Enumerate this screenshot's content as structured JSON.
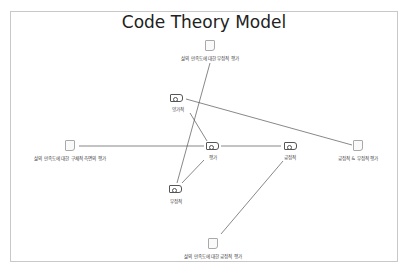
{
  "diagram": {
    "title": "Code Theory Model",
    "colors": {
      "border": "#c8c8c8",
      "edge": "#555555",
      "doc_icon": "#a9a9a9",
      "code_icon": "#555555",
      "label": "#444444"
    },
    "nodes": [
      {
        "id": "doc_negative_eval",
        "type": "document",
        "label": "삶의 만족도에 대한 부정적 평가",
        "x": 210,
        "y": 45
      },
      {
        "id": "code_ambivalent",
        "type": "code",
        "label": "양가적",
        "x": 180,
        "y": 97
      },
      {
        "id": "doc_specific_aspect",
        "type": "document",
        "label": "삶의 만족도에 대한 구체적 측면의 평가",
        "x": 70,
        "y": 146
      },
      {
        "id": "code_evaluation",
        "type": "code",
        "label": "평가",
        "x": 213,
        "y": 146
      },
      {
        "id": "code_positive",
        "type": "code",
        "label": "긍정적",
        "x": 290,
        "y": 146
      },
      {
        "id": "doc_pos_neg_eval",
        "type": "document",
        "label": "긍정적 & 부정적 평가",
        "x": 360,
        "y": 148
      },
      {
        "id": "code_negative",
        "type": "code",
        "label": "부정적",
        "x": 176,
        "y": 190
      },
      {
        "id": "doc_positive_eval",
        "type": "document",
        "label": "삶의 만족도에 대한 긍정적 평가",
        "x": 213,
        "y": 245
      }
    ],
    "edges": [
      {
        "from": "doc_negative_eval",
        "to": "code_negative",
        "x1": 210,
        "y1": 63,
        "x2": 177,
        "y2": 183
      },
      {
        "from": "code_ambivalent",
        "to": "doc_pos_neg_eval",
        "x1": 186,
        "y1": 99,
        "x2": 352,
        "y2": 145
      },
      {
        "from": "code_ambivalent",
        "to": "code_evaluation",
        "x1": 190,
        "y1": 113,
        "x2": 207,
        "y2": 141
      },
      {
        "from": "doc_specific_aspect",
        "to": "code_evaluation",
        "x1": 79,
        "y1": 146,
        "x2": 204,
        "y2": 146
      },
      {
        "from": "code_evaluation",
        "to": "code_positive",
        "x1": 221,
        "y1": 146,
        "x2": 281,
        "y2": 146
      },
      {
        "from": "code_evaluation",
        "to": "code_negative",
        "x1": 204,
        "y1": 160,
        "x2": 182,
        "y2": 183
      },
      {
        "from": "code_positive",
        "to": "doc_positive_eval",
        "x1": 283,
        "y1": 161,
        "x2": 221,
        "y2": 234
      }
    ]
  }
}
